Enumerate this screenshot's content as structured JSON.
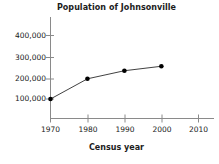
{
  "chart_data": {
    "type": "line",
    "title": "Population of Johnsonville",
    "xlabel": "Census year",
    "ylabel": "",
    "x": [
      1970,
      1980,
      1990,
      2000
    ],
    "values": [
      100000,
      200000,
      240000,
      262000
    ],
    "series": [
      {
        "name": "Population",
        "x": [
          1970,
          1980,
          1990,
          2000
        ],
        "values": [
          100000,
          200000,
          240000,
          262000
        ]
      }
    ],
    "xlim": [
      1965,
      2014
    ],
    "ylim": [
      0,
      440000
    ],
    "xticks": [
      1970,
      1980,
      1990,
      2000,
      2010
    ],
    "xticklabels": [
      "1970",
      "1980",
      "1990",
      "2000",
      "2010"
    ],
    "yticks": [
      100000,
      200000,
      300000,
      400000
    ],
    "yticklabels": [
      "100,000",
      "200,000",
      "300,000",
      "400,000"
    ],
    "grid": false,
    "legend": null,
    "marker": "filled-circle",
    "line_color": "#2b2b2b",
    "marker_color": "#000000",
    "axis_color": "#808080",
    "background": "#ffffff"
  },
  "axes": {
    "y_tick_labels": [
      {
        "text": "400,000"
      },
      {
        "text": "300,000"
      },
      {
        "text": "200,000"
      },
      {
        "text": "100,000"
      }
    ],
    "x_tick_labels": [
      {
        "text": "1970"
      },
      {
        "text": "1980"
      },
      {
        "text": "1990"
      },
      {
        "text": "2000"
      },
      {
        "text": "2010"
      }
    ]
  }
}
